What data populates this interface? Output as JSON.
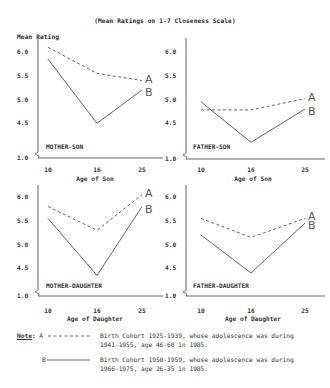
{
  "title": "(Mean Ratings on 1-7 Closeness Scale)",
  "y_axis_title": "Mean Rating",
  "y_ticks": [
    "6.0",
    "5.5",
    "5.0",
    "4.5",
    "1.0"
  ],
  "x_ticks": [
    "10",
    "16",
    "25"
  ],
  "series_labels": [
    "A",
    "B"
  ],
  "panels": [
    {
      "label": "MOTHER-SON",
      "xlabel": "Age of Son"
    },
    {
      "label": "FATHER-SON",
      "xlabel": "Age of Son"
    },
    {
      "label": "MOTHER-DAUGHTER",
      "xlabel": "Age of Daughter"
    },
    {
      "label": "FATHER-DAUGHTER",
      "xlabel": "Age of Daughter"
    }
  ],
  "note": {
    "label": "Note",
    "a_key": "A",
    "a_text_1": "Birth Cohort 1925-1939, whose adolescence was during",
    "a_text_2": "1941-1955, age 46-60 in 1985.",
    "b_key": "B",
    "b_text_1": "Birth Cohort 1950-1959, whose adolescence was during",
    "b_text_2": "1966-1975, age 26-35 in 1985."
  },
  "chart_data": [
    {
      "type": "line",
      "title": "MOTHER-SON",
      "xlabel": "Age of Son",
      "ylabel": "Mean Rating",
      "categories": [
        "10",
        "16",
        "25"
      ],
      "series": [
        {
          "name": "A (Birth Cohort 1925-1939)",
          "style": "dashed",
          "values": [
            6.1,
            5.55,
            5.4
          ]
        },
        {
          "name": "B (Birth Cohort 1950-1959)",
          "style": "solid",
          "values": [
            5.85,
            4.5,
            5.2
          ]
        }
      ],
      "y_ticks": [
        1.0,
        4.5,
        5.0,
        5.5,
        6.0
      ],
      "ylim": [
        1.0,
        6.2
      ],
      "axis_break": true,
      "grid": false
    },
    {
      "type": "line",
      "title": "FATHER-SON",
      "xlabel": "Age of Son",
      "ylabel": "Mean Rating",
      "categories": [
        "10",
        "16",
        "25"
      ],
      "series": [
        {
          "name": "A (Birth Cohort 1925-1939)",
          "style": "dashed",
          "values": [
            4.78,
            4.78,
            5.02
          ]
        },
        {
          "name": "B (Birth Cohort 1950-1959)",
          "style": "solid",
          "values": [
            4.95,
            4.1,
            4.8
          ]
        }
      ],
      "y_ticks": [
        1.0,
        4.5,
        5.0,
        5.5,
        6.0
      ],
      "ylim": [
        1.0,
        6.2
      ],
      "axis_break": true,
      "grid": false
    },
    {
      "type": "line",
      "title": "MOTHER-DAUGHTER",
      "xlabel": "Age of Daughter",
      "ylabel": "Mean Rating",
      "categories": [
        "10",
        "16",
        "25"
      ],
      "series": [
        {
          "name": "A (Birth Cohort 1925-1939)",
          "style": "dashed",
          "values": [
            5.8,
            5.3,
            6.05
          ]
        },
        {
          "name": "B (Birth Cohort 1950-1959)",
          "style": "solid",
          "values": [
            5.55,
            4.35,
            5.8
          ]
        }
      ],
      "y_ticks": [
        1.0,
        4.5,
        5.0,
        5.5,
        6.0
      ],
      "ylim": [
        1.0,
        6.2
      ],
      "axis_break": true,
      "grid": false
    },
    {
      "type": "line",
      "title": "FATHER-DAUGHTER",
      "xlabel": "Age of Daughter",
      "ylabel": "Mean Rating",
      "categories": [
        "10",
        "16",
        "25"
      ],
      "series": [
        {
          "name": "A (Birth Cohort 1925-1939)",
          "style": "dashed",
          "values": [
            5.55,
            5.15,
            5.55
          ]
        },
        {
          "name": "B (Birth Cohort 1950-1959)",
          "style": "solid",
          "values": [
            5.2,
            4.4,
            5.45
          ]
        }
      ],
      "y_ticks": [
        1.0,
        4.5,
        5.0,
        5.5,
        6.0
      ],
      "ylim": [
        1.0,
        6.2
      ],
      "axis_break": true,
      "grid": false
    }
  ]
}
